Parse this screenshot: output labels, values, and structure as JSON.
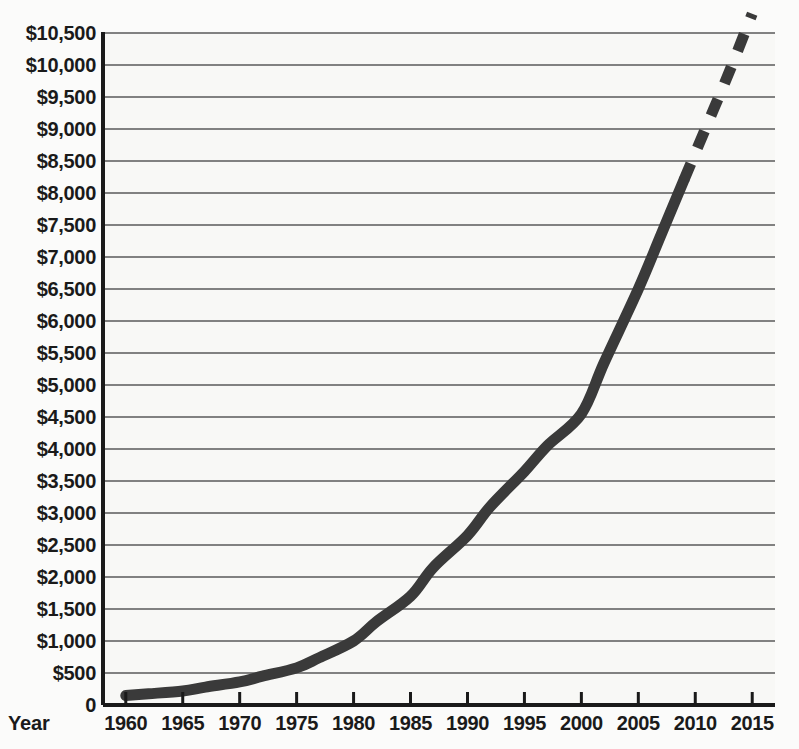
{
  "chart_data": {
    "type": "line",
    "title": "",
    "xlabel": "Year",
    "ylabel": "",
    "grid": true,
    "legend": false,
    "xlim": [
      1958,
      2017
    ],
    "ylim": [
      0,
      10500
    ],
    "x_tick_labels": [
      "1960",
      "1965",
      "1970",
      "1975",
      "1980",
      "1985",
      "1990",
      "1995",
      "2000",
      "2005",
      "2010",
      "2015"
    ],
    "x_ticks": [
      1960,
      1965,
      1970,
      1975,
      1980,
      1985,
      1990,
      1995,
      2000,
      2005,
      2010,
      2015
    ],
    "y_tick_labels": [
      "0",
      "$500",
      "$1,000",
      "$1,500",
      "$2,000",
      "$2,500",
      "$3,000",
      "$3,500",
      "$4,000",
      "$4,500",
      "$5,000",
      "$5,500",
      "$6,000",
      "$6,500",
      "$7,000",
      "$7,500",
      "$8,000",
      "$8,500",
      "$9,000",
      "$9,500",
      "$10,000",
      "$10,500"
    ],
    "y_ticks": [
      0,
      500,
      1000,
      1500,
      2000,
      2500,
      3000,
      3500,
      4000,
      4500,
      5000,
      5500,
      6000,
      6500,
      7000,
      7500,
      8000,
      8500,
      9000,
      9500,
      10000,
      10500
    ],
    "series": [
      {
        "name": "actual",
        "style": "solid",
        "color": "#3a3a3a",
        "line_width": 11,
        "x": [
          1960,
          1962,
          1965,
          1967,
          1970,
          1972,
          1975,
          1977,
          1980,
          1982,
          1985,
          1987,
          1990,
          1992,
          1995,
          1997,
          2000,
          2002,
          2005,
          2007,
          2009
        ],
        "values": [
          148,
          175,
          220,
          280,
          360,
          450,
          580,
          740,
          1000,
          1300,
          1700,
          2150,
          2650,
          3100,
          3650,
          4050,
          4550,
          5350,
          6500,
          7350,
          8200
        ]
      },
      {
        "name": "projected",
        "style": "dashed",
        "color": "#3a3a3a",
        "line_width": 11,
        "x": [
          2009,
          2011,
          2013,
          2015
        ],
        "values": [
          8200,
          9050,
          9900,
          10800
        ]
      }
    ],
    "colors": {
      "line": "#3a3a3a",
      "gridline": "#5a5a5a",
      "axis": "#1a1a1a",
      "plot_background": "#f8f8f6",
      "page_background": "#fbfbfa",
      "text": "#1a1a1a"
    }
  }
}
